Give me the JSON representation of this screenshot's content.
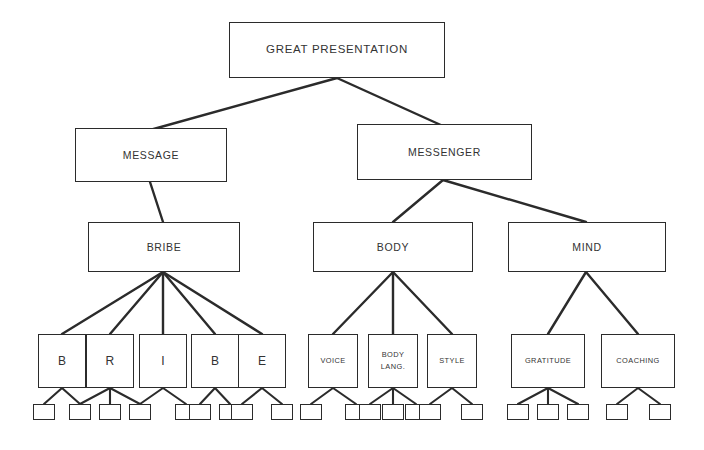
{
  "diagram": {
    "background_color": "#ffffff",
    "line_color": "#2b2b2b",
    "text_color": "#333333",
    "nodes": {
      "root": {
        "label": "GREAT PRESENTATION"
      },
      "message": {
        "label": "MESSAGE"
      },
      "messenger": {
        "label": "MESSENGER"
      },
      "bribe": {
        "label": "BRIBE"
      },
      "body": {
        "label": "BODY"
      },
      "mind": {
        "label": "MIND"
      },
      "bribe_b1": {
        "label": "B"
      },
      "bribe_r": {
        "label": "R"
      },
      "bribe_i": {
        "label": "I"
      },
      "bribe_b2": {
        "label": "B"
      },
      "bribe_e": {
        "label": "E"
      },
      "voice": {
        "label": "VOICE"
      },
      "body_lang": {
        "label_line1": "BODY",
        "label_line2": "LANG."
      },
      "style": {
        "label": "STYLE"
      },
      "gratitude": {
        "label": "GRATITUDE"
      },
      "coaching": {
        "label": "COACHING"
      }
    },
    "leaf_counts": {
      "bribe_b1": 2,
      "bribe_r": 3,
      "bribe_i": 2,
      "bribe_b2": 2,
      "bribe_e": 2,
      "voice": 2,
      "body_lang": 3,
      "style": 2,
      "gratitude": 3,
      "coaching": 2
    }
  }
}
